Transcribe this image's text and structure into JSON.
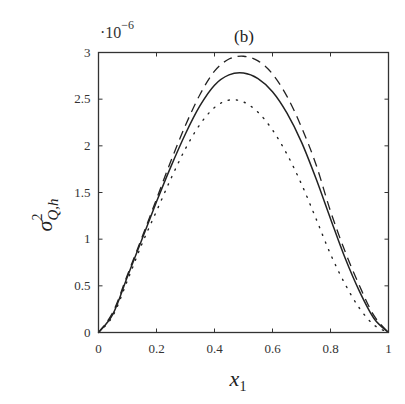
{
  "chart_data": {
    "type": "line",
    "title": "(b)",
    "xlabel": "x_1",
    "ylabel": "σ²_{Q,h}",
    "y_exponent": "·10^-6",
    "xlim": [
      0,
      1
    ],
    "ylim": [
      0,
      3
    ],
    "xticks": [
      "0",
      "0.2",
      "0.4",
      "0.6",
      "0.8",
      "1"
    ],
    "yticks": [
      "0",
      "0.5",
      "1",
      "1.5",
      "2",
      "2.5",
      "3"
    ],
    "grid": false,
    "legend": null,
    "x": [
      0,
      0.05,
      0.1,
      0.15,
      0.2,
      0.25,
      0.3,
      0.35,
      0.4,
      0.45,
      0.5,
      0.55,
      0.6,
      0.65,
      0.7,
      0.75,
      0.8,
      0.85,
      0.9,
      0.95,
      1
    ],
    "series": [
      {
        "name": "dashed",
        "style": "dashed",
        "values": [
          0,
          0.22,
          0.62,
          1.02,
          1.43,
          1.84,
          2.22,
          2.55,
          2.8,
          2.93,
          2.96,
          2.91,
          2.77,
          2.53,
          2.2,
          1.8,
          1.3,
          0.87,
          0.5,
          0.18,
          0
        ]
      },
      {
        "name": "solid",
        "style": "solid",
        "values": [
          0,
          0.2,
          0.6,
          1.0,
          1.4,
          1.78,
          2.13,
          2.43,
          2.65,
          2.76,
          2.78,
          2.72,
          2.58,
          2.35,
          2.04,
          1.65,
          1.22,
          0.8,
          0.44,
          0.15,
          0
        ]
      },
      {
        "name": "dotted",
        "style": "dotted",
        "values": [
          0,
          0.18,
          0.56,
          0.95,
          1.3,
          1.65,
          1.97,
          2.23,
          2.41,
          2.49,
          2.47,
          2.36,
          2.17,
          1.91,
          1.59,
          1.22,
          0.84,
          0.52,
          0.26,
          0.08,
          0
        ]
      }
    ]
  },
  "labels": {
    "title": "(b)",
    "exp_base": "·10",
    "exp_power": "−6",
    "xlabel_main": "x",
    "xlabel_sub": "1",
    "ylabel_main": "σ",
    "ylabel_sup": "2",
    "ylabel_sub": "Q,h"
  }
}
